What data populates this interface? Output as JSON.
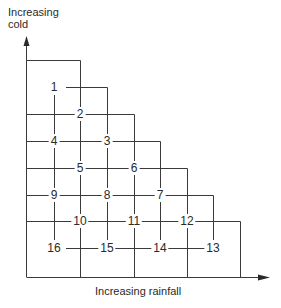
{
  "diagram": {
    "y_axis_label": "Increasing cold",
    "y_axis_label_lines": [
      "Increasing",
      "cold"
    ],
    "x_axis_label": "Increasing rainfall",
    "grid": {
      "columns_x": [
        54,
        80,
        107,
        134,
        160,
        187,
        213,
        240
      ],
      "rows_y": [
        60,
        87,
        114,
        141,
        168,
        195,
        221,
        248,
        277
      ]
    },
    "cells": [
      {
        "label": "1",
        "x": 54,
        "y": 87
      },
      {
        "label": "2",
        "x": 80,
        "y": 114
      },
      {
        "label": "3",
        "x": 107,
        "y": 141
      },
      {
        "label": "4",
        "x": 54,
        "y": 141
      },
      {
        "label": "5",
        "x": 80,
        "y": 168
      },
      {
        "label": "6",
        "x": 134,
        "y": 168
      },
      {
        "label": "7",
        "x": 160,
        "y": 195
      },
      {
        "label": "8",
        "x": 107,
        "y": 195
      },
      {
        "label": "9",
        "x": 54,
        "y": 195
      },
      {
        "label": "10",
        "x": 80,
        "y": 221
      },
      {
        "label": "11",
        "x": 134,
        "y": 221
      },
      {
        "label": "12",
        "x": 187,
        "y": 221
      },
      {
        "label": "13",
        "x": 213,
        "y": 248
      },
      {
        "label": "14",
        "x": 160,
        "y": 248
      },
      {
        "label": "15",
        "x": 107,
        "y": 248
      },
      {
        "label": "16",
        "x": 54,
        "y": 248
      }
    ],
    "line_color": "#3a3a3a"
  }
}
